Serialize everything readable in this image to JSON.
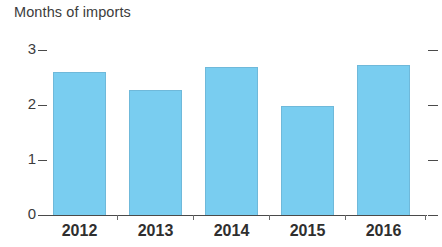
{
  "chart_data": {
    "type": "bar",
    "title": "Months of imports",
    "subtitle": "",
    "xlabel": "",
    "ylabel": "Months of imports",
    "categories": [
      "2012",
      "2013",
      "2014",
      "2015",
      "2016"
    ],
    "values": [
      2.6,
      2.27,
      2.7,
      1.98,
      2.73
    ],
    "series": [
      {
        "name": "Months of imports",
        "values": [
          2.6,
          2.27,
          2.7,
          1.98,
          2.73
        ]
      }
    ],
    "ylim": [
      0,
      3
    ],
    "y_ticks": [
      "0",
      "1",
      "2",
      "3"
    ],
    "y_tick_values": [
      0,
      1,
      2,
      3
    ],
    "grid": false,
    "legend": false,
    "legend_position": "none",
    "bar_color": "#79cdf0",
    "bar_edge_color": "#6fb9da",
    "axis_color": "#4a4a4a",
    "text_color": "#3c3c3c",
    "right_axis_ticks": true,
    "annotations": []
  },
  "chart": {
    "title": "Months of imports"
  }
}
